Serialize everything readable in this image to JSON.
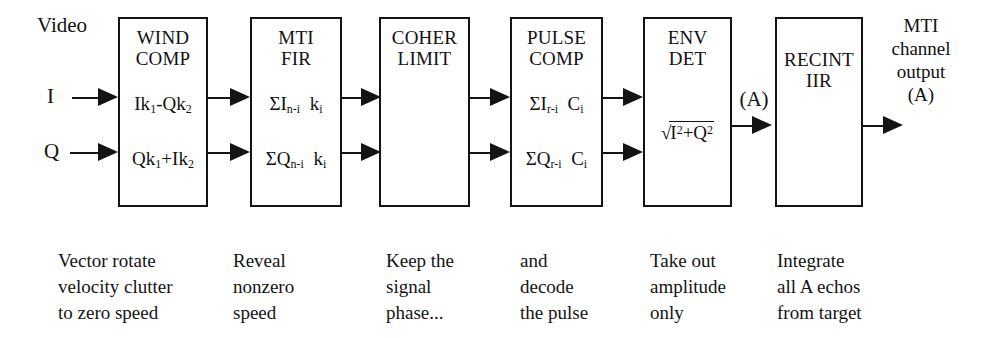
{
  "diagram": {
    "title_text": "Video",
    "inputs": [
      {
        "label": "I",
        "name": "input-i"
      },
      {
        "label": "Q",
        "name": "input-q"
      }
    ],
    "blocks": [
      {
        "id": "wind-comp",
        "title": "WIND\nCOMP",
        "formula_i": "Ik1-Qk2",
        "formula_q": "Qk1+Ik2",
        "caption": "Vector rotate\nvelocity clutter\nto zero speed"
      },
      {
        "id": "mti-fir",
        "title": "MTI\nFIR",
        "formula_i": "ΣIn-i  ki",
        "formula_q": "ΣQn-i  ki",
        "caption": "Reveal\nnonzero\nspeed"
      },
      {
        "id": "coher-limit",
        "title": "COHER\nLIMIT",
        "formula_i": "",
        "formula_q": "",
        "caption": "Keep the\nsignal\nphase..."
      },
      {
        "id": "pulse-comp",
        "title": "PULSE\nCOMP",
        "formula_i": "ΣIr-i  Ci",
        "formula_q": "ΣQr-i  Ci",
        "caption": "and\ndecode\nthe pulse"
      },
      {
        "id": "env-det",
        "title": "ENV\nDET",
        "radical": "√I²+Q²",
        "caption": "Take out\namplitude\nonly"
      },
      {
        "id": "recint-iir",
        "title": "RECINT\nIIR",
        "caption": "Integrate\nall A echos\nfrom target"
      }
    ],
    "amplitude_tap_label": "(A)",
    "output_label": "MTI\nchannel\noutput\n(A)",
    "colors": {
      "stroke": "#141414",
      "background": "#ffffff",
      "text": "#111111"
    }
  }
}
